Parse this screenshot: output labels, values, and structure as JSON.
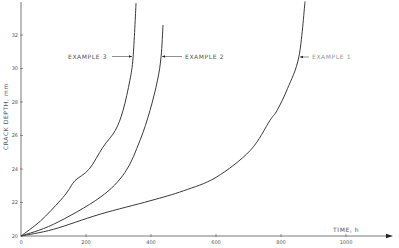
{
  "chart_data": {
    "type": "line",
    "title": "",
    "xlabel": "TIME, h",
    "ylabel": "CRACK DEPTH, mm",
    "xlim": [
      0,
      1000
    ],
    "ylim": [
      20,
      33.5
    ],
    "x_ticks": [
      0,
      200,
      400,
      600,
      800,
      1000
    ],
    "x_tick_labels": [
      "0",
      "200",
      "400",
      "600",
      "800",
      "1000"
    ],
    "y_ticks": [
      20,
      22,
      24,
      26,
      28,
      30,
      32
    ],
    "y_tick_labels": [
      "20",
      "22",
      "24",
      "26",
      "28",
      "30",
      "32"
    ],
    "grid": false,
    "legend": "inline annotations with arrows",
    "series": [
      {
        "name": "EXAMPLE 1",
        "points": [
          [
            0,
            20
          ],
          [
            100,
            20.4
          ],
          [
            243,
            21.3
          ],
          [
            397,
            22.1
          ],
          [
            500,
            22.7
          ],
          [
            600,
            23.5
          ],
          [
            705,
            25.1
          ],
          [
            766,
            26.9
          ],
          [
            788,
            27.5
          ],
          [
            820,
            28.8
          ],
          [
            855,
            30.7
          ],
          [
            874,
            34.0
          ]
        ]
      },
      {
        "name": "EXAMPLE 2",
        "points": [
          [
            0,
            20
          ],
          [
            100,
            20.7
          ],
          [
            243,
            22.3
          ],
          [
            320,
            23.8
          ],
          [
            366,
            25.7
          ],
          [
            397,
            27.5
          ],
          [
            420,
            29.3
          ],
          [
            431,
            30.7
          ],
          [
            437,
            32.6
          ]
        ]
      },
      {
        "name": "EXAMPLE 3",
        "points": [
          [
            0,
            20
          ],
          [
            60,
            20.9
          ],
          [
            120,
            22.1
          ],
          [
            145,
            22.7
          ],
          [
            166,
            23.3
          ],
          [
            210,
            24.0
          ],
          [
            252,
            25.3
          ],
          [
            290,
            26.3
          ],
          [
            314,
            27.5
          ],
          [
            335,
            29.3
          ],
          [
            345,
            30.7
          ],
          [
            354,
            33.9
          ]
        ]
      }
    ],
    "annotations": [
      {
        "text": "EXAMPLE 3",
        "arrow_to": [
          345,
          30.7
        ]
      },
      {
        "text": "EXAMPLE 2",
        "arrow_to": [
          431,
          30.7
        ]
      },
      {
        "text": "EXAMPLE 1",
        "arrow_to": [
          855,
          30.7
        ]
      }
    ]
  },
  "labels": {
    "xlabel": "TIME, h",
    "ylabel": "CRACK DEPTH, mm",
    "ex1": "EXAMPLE 1",
    "ex2": "EXAMPLE 2",
    "ex3": "EXAMPLE 3"
  },
  "colors": {
    "line": "#3a3a3a",
    "axis": "#555555",
    "text": "#555555"
  }
}
